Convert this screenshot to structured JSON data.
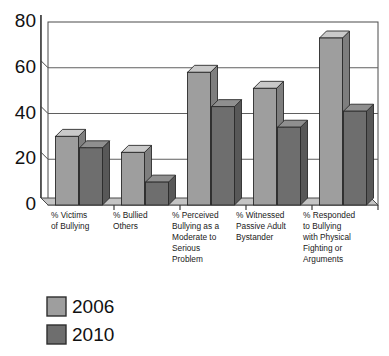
{
  "chart_data": {
    "type": "bar",
    "title": "",
    "subtitle": "",
    "xlabel": "",
    "ylabel": "",
    "ylim": [
      0,
      80
    ],
    "yticks": [
      0,
      20,
      40,
      60,
      80
    ],
    "ytick_labels": [
      "0",
      "20",
      "40",
      "60",
      "80"
    ],
    "grid": true,
    "grid_axis": "y",
    "legend_position": "bottom-left",
    "style": "3d-grouped-bars",
    "categories": [
      "% Victims of Bullying",
      "% Bullied Others",
      "% Perceived Bullying as a Moderate to Serious Problem",
      "% Witnessed Passive Adult Bystander",
      "% Responded to Bullying with Physical Fighting or Arguments"
    ],
    "category_label_lines": [
      [
        "% Victims",
        "of Bullying"
      ],
      [
        "% Bullied",
        "Others"
      ],
      [
        "% Perceived",
        "Bullying as a",
        "Moderate to",
        "Serious",
        "Problem"
      ],
      [
        "% Witnessed",
        "Passive Adult",
        "Bystander"
      ],
      [
        "% Responded",
        "to Bullying",
        "with Physical",
        "Fighting or",
        "Arguments"
      ]
    ],
    "series": [
      {
        "name": "2006",
        "color": "#9e9e9e",
        "values": [
          30,
          23,
          58,
          51,
          73
        ]
      },
      {
        "name": "2010",
        "color": "#6e6e6e",
        "values": [
          25,
          10,
          43,
          34,
          41
        ]
      }
    ]
  },
  "legend": {
    "items": [
      {
        "label": "2006",
        "color": "#9e9e9e"
      },
      {
        "label": "2010",
        "color": "#6e6e6e"
      }
    ]
  },
  "axis": {
    "y_tick_labels": [
      "80",
      "60",
      "40",
      "20",
      "0"
    ]
  },
  "colors": {
    "background": "#ffffff",
    "plot_background": "#ffffff",
    "axis_line": "#3b3b3b",
    "gridline": "#6b6b6b",
    "floor": "#bdbdbd",
    "wall": "#d4d4d4",
    "series_2006_front": "#9e9e9e",
    "series_2006_top": "#c9c9c9",
    "series_2006_side": "#7e7e7e",
    "series_2010_front": "#6e6e6e",
    "series_2010_top": "#8f8f8f",
    "series_2010_side": "#585858",
    "text": "#111111"
  }
}
